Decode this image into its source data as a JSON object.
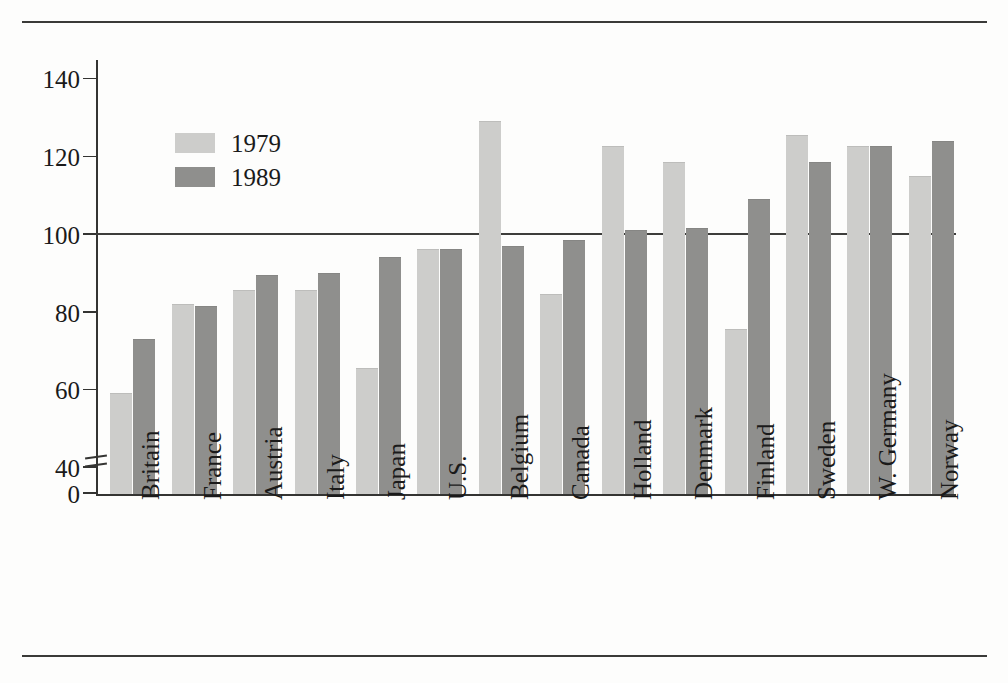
{
  "chart_data": {
    "type": "bar",
    "title": "",
    "subtitle": "",
    "xlabel": "",
    "ylabel": "",
    "ylim": [
      0,
      145
    ],
    "yticks": [
      0,
      40,
      60,
      80,
      100,
      120,
      140
    ],
    "ytick_labels": [
      "0",
      "40",
      "60",
      "80",
      "100",
      "120",
      "140"
    ],
    "axis_break": true,
    "axis_break_between": [
      0,
      40
    ],
    "grid": false,
    "reference_line": 100,
    "legend_position": "upper-left-inside",
    "categories": [
      "Britain",
      "France",
      "Austria",
      "Italy",
      "Japan",
      "U.S.",
      "Belgium",
      "Canada",
      "Holland",
      "Denmark",
      "Finland",
      "Sweden",
      "W. Germany",
      "Norway"
    ],
    "series": [
      {
        "name": "1979",
        "color": "#cdcdcb",
        "values": [
          59,
          82,
          85.5,
          85.5,
          65.5,
          96,
          129,
          84.5,
          122.5,
          118.5,
          75.5,
          125.5,
          122.5,
          115
        ]
      },
      {
        "name": "1989",
        "color": "#8f8f8d",
        "values": [
          73,
          81.5,
          89.5,
          90,
          94,
          96,
          97,
          98.5,
          101,
          101.5,
          109,
          118.5,
          122.5,
          124
        ]
      }
    ]
  },
  "figure": {
    "legend": {
      "items": [
        {
          "label": "1979",
          "color": "#cdcdcb"
        },
        {
          "label": "1989",
          "color": "#8f8f8d"
        }
      ]
    },
    "rules": {
      "top": "horizontal-rule",
      "bottom": "horizontal-rule"
    }
  }
}
